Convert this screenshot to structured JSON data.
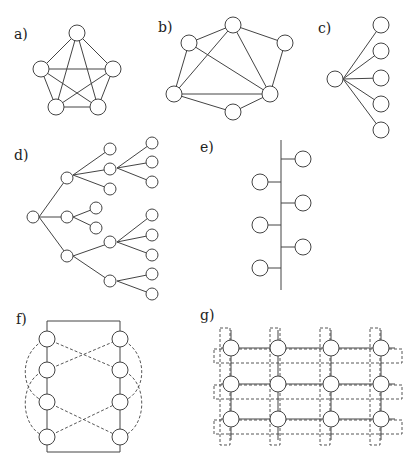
{
  "colors": {
    "stroke": "#444444",
    "background": "#ffffff",
    "node_fill": "#ffffff"
  },
  "panels": [
    {
      "id": "a",
      "label": "a)",
      "description": "Fully connected network (5 nodes)"
    },
    {
      "id": "b",
      "label": "b)",
      "description": "Mesh network (6 nodes)"
    },
    {
      "id": "c",
      "label": "c)",
      "description": "Star network (1 hub, 5 leaves)"
    },
    {
      "id": "d",
      "label": "d)",
      "description": "Tree network"
    },
    {
      "id": "e",
      "label": "e)",
      "description": "Bus network (6 nodes)"
    },
    {
      "id": "f",
      "label": "f)",
      "description": "Ring / double-loop network with dashed cross links"
    },
    {
      "id": "g",
      "label": "g)",
      "description": "Grid / torus network 4x3 with dashed wraparound"
    }
  ]
}
